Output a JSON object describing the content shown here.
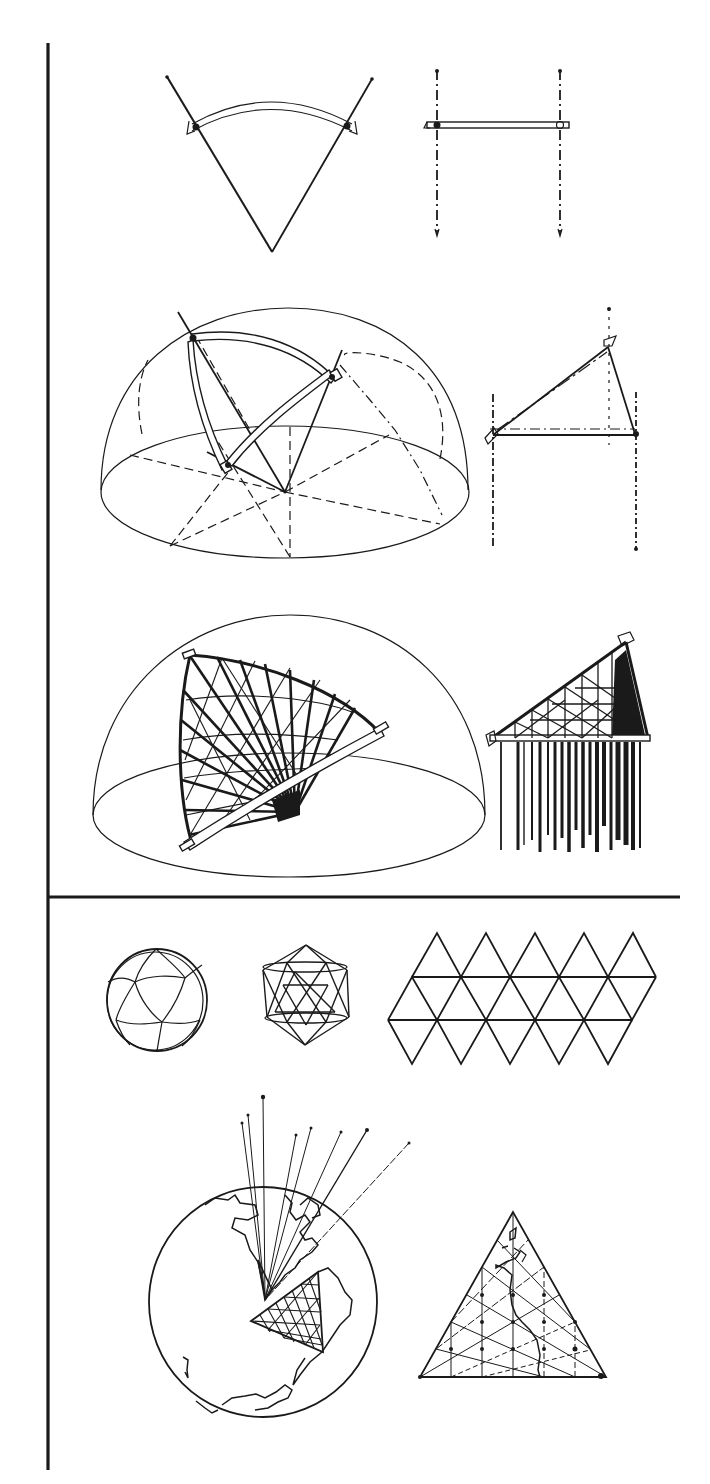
{
  "figure": {
    "frame": {
      "vertical_rule_x": 48,
      "vertical_rule_top": 43,
      "vertical_rule_bottom": 1470,
      "divider_y": 897,
      "divider_right": 680,
      "ink_color": "#1a1a1a",
      "paper_color": "#ffffff"
    },
    "upper_section": {
      "label": "Great-circle arc construction",
      "panels": [
        {
          "id": "arc-between-radii",
          "description": "Two radii with a curved great-circle strut between them"
        },
        {
          "id": "side-elevation-h",
          "description": "Side elevation of two posts joined by a horizontal bar"
        },
        {
          "id": "hemisphere-single-triangle",
          "description": "Hemisphere with one spherical triangle of curved struts"
        },
        {
          "id": "side-elevation-triangle",
          "description": "Side elevation of the triangle with vertical projection lines"
        },
        {
          "id": "hemisphere-subdivided-triangle",
          "description": "Hemisphere with fully subdivided spherical triangle and radial rays"
        },
        {
          "id": "side-elevation-dense",
          "description": "Side elevation of subdivided triangle with dense projection lines"
        }
      ]
    },
    "lower_section": {
      "label": "Icosahedral projection",
      "panels": [
        {
          "id": "spherical-icosahedron",
          "description": "Sphere with spherical icosahedron edges"
        },
        {
          "id": "wireframe-icosahedron",
          "description": "Wireframe icosahedron"
        },
        {
          "id": "icosahedron-net",
          "description": "Flat net of 20 triangles",
          "rows": 4,
          "columns": 5
        },
        {
          "id": "globe-projection",
          "description": "Globe with projection rays and triangular grid over South America",
          "ray_count": 8
        },
        {
          "id": "flat-triangle-map",
          "description": "Flattened triangular face with grid and coastline"
        }
      ]
    }
  }
}
